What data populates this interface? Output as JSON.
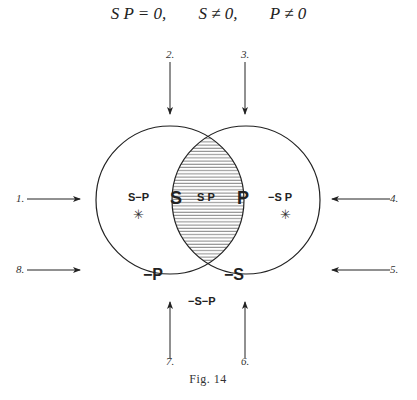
{
  "equation": {
    "terms": [
      "S P = 0,",
      "S ≠ 0,",
      "P ≠ 0"
    ]
  },
  "circles": {
    "left": {
      "label": "S",
      "complement_label": "−P"
    },
    "right": {
      "label": "P",
      "complement_label": "−S"
    }
  },
  "regions": {
    "s_not_p": "S−P",
    "s_and_p": "S P",
    "not_s_p": "−S P",
    "neither": "−S−P",
    "star_symbol": "✳"
  },
  "arrows": [
    {
      "num": "1.",
      "direction": "right"
    },
    {
      "num": "2.",
      "direction": "down"
    },
    {
      "num": "3.",
      "direction": "down"
    },
    {
      "num": "4.",
      "direction": "left"
    },
    {
      "num": "5.",
      "direction": "left"
    },
    {
      "num": "6.",
      "direction": "up"
    },
    {
      "num": "7.",
      "direction": "up"
    },
    {
      "num": "8.",
      "direction": "right"
    }
  ],
  "caption": "Fig. 14",
  "colors": {
    "line": "#222222",
    "hatch": "#555555",
    "background": "#ffffff"
  }
}
